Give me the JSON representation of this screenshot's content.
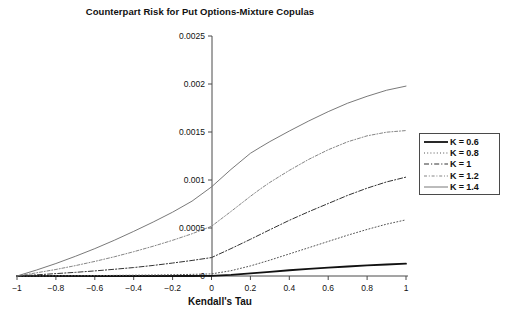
{
  "chart_data": {
    "type": "line",
    "title": "Counterpart Risk for Put Options-Mixture Copulas",
    "xlabel": "Kendall's Tau",
    "ylabel": "",
    "xlim": [
      -1,
      1
    ],
    "ylim": [
      0,
      0.0025
    ],
    "grid": false,
    "legend_position": "right",
    "xticks": [
      -1,
      -0.8,
      -0.6,
      -0.4,
      -0.2,
      0,
      0.2,
      0.4,
      0.6,
      0.8,
      1
    ],
    "xtick_labels": [
      "−1",
      "−0.8",
      "−0.6",
      "−0.4",
      "−0.2",
      "0",
      "0.2",
      "0.4",
      "0.6",
      "0.8",
      "1"
    ],
    "yticks": [
      0,
      0.0005,
      0.001,
      0.0015,
      0.002,
      0.0025
    ],
    "ytick_labels": [
      "0",
      "0.0005",
      "0.001",
      "0.0015",
      "0.002",
      "0.0025"
    ],
    "x": [
      -1,
      -0.9,
      -0.8,
      -0.7,
      -0.6,
      -0.5,
      -0.4,
      -0.3,
      -0.2,
      -0.1,
      0,
      0.1,
      0.2,
      0.25,
      0.3,
      0.4,
      0.5,
      0.6,
      0.7,
      0.8,
      0.9,
      1
    ],
    "series": [
      {
        "name": "K = 0.6",
        "style": "solid-thick",
        "color": "#111111",
        "values": [
          0,
          0,
          0,
          0,
          0,
          0,
          0,
          0,
          0,
          0,
          2e-06,
          1.2e-05,
          2.8e-05,
          3.6e-05,
          4.4e-05,
          6e-05,
          7.4e-05,
          8.7e-05,
          9.9e-05,
          0.00011,
          0.00012,
          0.000128
        ]
      },
      {
        "name": "K = 0.8",
        "style": "dotted",
        "color": "#555555",
        "values": [
          0,
          1e-06,
          2e-06,
          3e-06,
          4e-06,
          6e-06,
          8e-06,
          1e-05,
          1.3e-05,
          1.7e-05,
          2.2e-05,
          5.5e-05,
          0.000105,
          0.000135,
          0.000165,
          0.00023,
          0.000295,
          0.00036,
          0.000425,
          0.000485,
          0.00054,
          0.000585
        ]
      },
      {
        "name": "K = 1",
        "style": "dash-dot",
        "color": "#333333",
        "values": [
          0,
          1.2e-05,
          2.5e-05,
          3.8e-05,
          5.3e-05,
          7e-05,
          8.8e-05,
          0.00011,
          0.000135,
          0.000162,
          0.000192,
          0.000285,
          0.000382,
          0.000432,
          0.000482,
          0.00058,
          0.00067,
          0.000755,
          0.00084,
          0.000915,
          0.00098,
          0.00103
        ]
      },
      {
        "name": "K = 1.2",
        "style": "dash-dot-fine",
        "color": "#777777",
        "values": [
          0,
          3.3e-05,
          6.8e-05,
          0.000108,
          0.000152,
          0.0002,
          0.000253,
          0.00031,
          0.000372,
          0.00044,
          0.000518,
          0.000672,
          0.00083,
          0.000905,
          0.000975,
          0.0011,
          0.001215,
          0.001315,
          0.001398,
          0.00146,
          0.001498,
          0.001515
        ]
      },
      {
        "name": "K = 1.4",
        "style": "solid-thin",
        "color": "#6a6a6a",
        "values": [
          0,
          6.2e-05,
          0.00013,
          0.000205,
          0.000285,
          0.000372,
          0.000465,
          0.000562,
          0.000665,
          0.00078,
          0.000928,
          0.00111,
          0.001278,
          0.00134,
          0.0014,
          0.00151,
          0.001615,
          0.001712,
          0.0018,
          0.001872,
          0.001935,
          0.001978
        ]
      }
    ]
  },
  "legend": {
    "items": [
      {
        "label": "K = 0.6"
      },
      {
        "label": "K = 0.8"
      },
      {
        "label": "K = 1"
      },
      {
        "label": "K = 1.2"
      },
      {
        "label": "K = 1.4"
      }
    ]
  },
  "colors": {
    "axis": "#4a4a4a",
    "text": "#111111",
    "background": "#ffffff"
  }
}
